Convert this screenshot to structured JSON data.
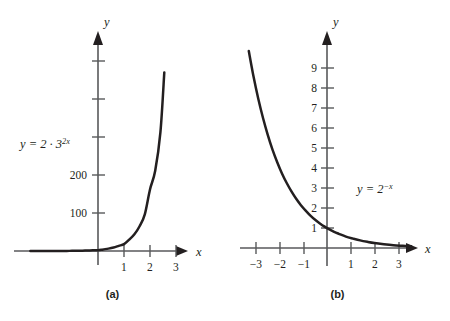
{
  "figure": {
    "background": "#ffffff",
    "ink": "#231f20",
    "axis_color": "#58595b"
  },
  "chart_data": [
    {
      "id": "panel-a",
      "type": "line",
      "title": "",
      "caption": "(a)",
      "equation_label": "y = 2 · 3",
      "equation_exponent": "2x",
      "function": "y = 2 * 3^(2x)",
      "xlabel": "x",
      "ylabel": "y",
      "xlim": [
        -2.6,
        3.6
      ],
      "ylim": [
        -60,
        560
      ],
      "x_ticks": [
        1,
        2,
        3
      ],
      "x_tick_labels": [
        "1",
        "2",
        "3"
      ],
      "y_ticks": [
        100,
        200,
        300,
        400,
        500
      ],
      "y_tick_labels": [
        "100",
        "200",
        "",
        "",
        ""
      ],
      "grid": false,
      "legend": "none",
      "x": [
        -2.6,
        -2.4,
        -2.2,
        -2.0,
        -1.8,
        -1.6,
        -1.4,
        -1.2,
        -1.0,
        -0.8,
        -0.6,
        -0.4,
        -0.2,
        0.0,
        0.2,
        0.4,
        0.6,
        0.8,
        1.0,
        1.2,
        1.4,
        1.6,
        1.8,
        2.0,
        2.2,
        2.4,
        2.55
      ],
      "y": [
        0.017,
        0.026,
        0.038,
        0.057,
        0.084,
        0.124,
        0.184,
        0.272,
        0.4,
        0.592,
        0.876,
        1.296,
        1.918,
        2.0,
        4.2,
        6.22,
        9.2,
        13.6,
        18.0,
        29.8,
        44.1,
        65.2,
        96.5,
        162.0,
        211.0,
        312.0,
        470.0
      ]
    },
    {
      "id": "panel-b",
      "type": "line",
      "title": "",
      "caption": "(b)",
      "equation_label": "y = 2",
      "equation_exponent": "−x",
      "function": "y = 2^(-x)",
      "xlabel": "x",
      "ylabel": "y",
      "xlim": [
        -3.6,
        3.9
      ],
      "ylim": [
        -1.4,
        11.2
      ],
      "x_ticks": [
        -3,
        -2,
        -1,
        1,
        2,
        3
      ],
      "x_tick_labels": [
        "−3",
        "−2",
        "−1",
        "1",
        "2",
        "3"
      ],
      "y_ticks": [
        1,
        2,
        3,
        4,
        5,
        6,
        7,
        8,
        9
      ],
      "y_tick_labels": [
        "1",
        "2",
        "3",
        "4",
        "5",
        "6",
        "7",
        "8",
        "9"
      ],
      "grid": false,
      "legend": "none",
      "x": [
        -3.3,
        -3.1,
        -2.9,
        -2.7,
        -2.5,
        -2.3,
        -2.1,
        -1.9,
        -1.7,
        -1.5,
        -1.3,
        -1.1,
        -0.9,
        -0.7,
        -0.5,
        -0.3,
        -0.1,
        0.1,
        0.3,
        0.5,
        0.8,
        1.1,
        1.4,
        1.7,
        2.0,
        2.4,
        2.8,
        3.2,
        3.55
      ],
      "y": [
        9.85,
        8.57,
        7.46,
        6.5,
        5.66,
        4.92,
        4.29,
        3.73,
        3.25,
        2.83,
        2.46,
        2.14,
        1.87,
        1.62,
        1.41,
        1.23,
        1.07,
        0.93,
        0.81,
        0.71,
        0.57,
        0.47,
        0.38,
        0.31,
        0.25,
        0.19,
        0.14,
        0.11,
        0.085
      ]
    }
  ]
}
